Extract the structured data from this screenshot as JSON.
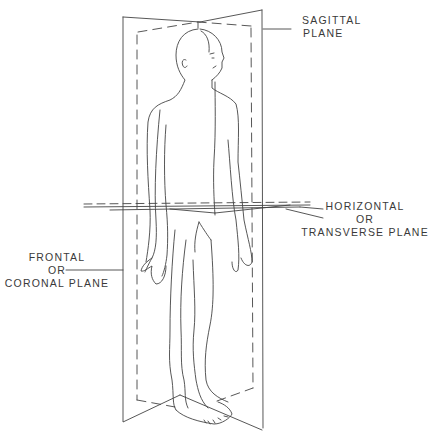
{
  "figure": {
    "line_color": "#444444",
    "background": "#ffffff"
  },
  "labels": {
    "sagittal": {
      "line1": "SAGITTAL",
      "line2": "PLANE"
    },
    "horizontal": {
      "line1": "HORIZONTAL",
      "line2": "OR",
      "line3": "TRANSVERSE PLANE"
    },
    "frontal": {
      "line1": "FRONTAL",
      "line2": "OR",
      "line3": "CORONAL PLANE"
    }
  }
}
